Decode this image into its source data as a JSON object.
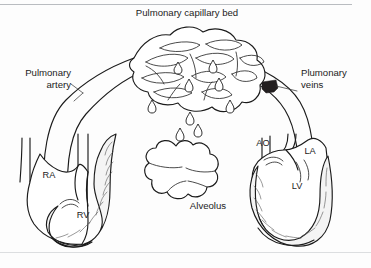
{
  "figure": {
    "title_label": "Pulmonary capillary bed",
    "alveolus_label": "Alveolus",
    "pulmonary_artery_label_line1": "Pulmonary",
    "pulmonary_artery_label_line2": "artery",
    "pulmonary_veins_label_line1": "Plumonary",
    "pulmonary_veins_label_line2": "veins",
    "chambers": {
      "right_atrium": "RA",
      "right_ventricle": "RV",
      "left_atrium": "LA",
      "left_ventricle": "LV",
      "aorta": "AO"
    },
    "colors": {
      "ink": "#1b1b1b",
      "background": "#fdfdfd",
      "wall_fill": "#f4f4f4",
      "marker": "#231f20",
      "frame_rule": "#b9bcc0"
    }
  }
}
